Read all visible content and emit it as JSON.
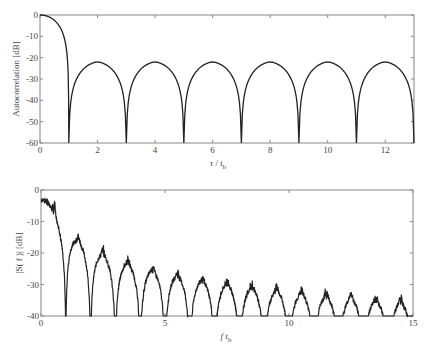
{
  "chart_data": [
    {
      "type": "line",
      "title": "",
      "xlabel": "τ / t_b",
      "ylabel": "Autocorrelation [dB]",
      "xlim": [
        0,
        13
      ],
      "ylim": [
        -60,
        0
      ],
      "xticks": [
        0,
        2,
        4,
        6,
        8,
        10,
        12
      ],
      "yticks": [
        0,
        -10,
        -20,
        -30,
        -40,
        -50,
        -60
      ],
      "grid": false,
      "legend": null,
      "description": "Main lobe falls from 0 dB at τ=0 to null at τ=1; sidelobe arches peak at about -22 dB at even τ with nulls at odd τ",
      "series": [
        {
          "name": "autocorrelation",
          "x": [
            0,
            0.25,
            0.5,
            0.75,
            0.9,
            1,
            1.1,
            1.5,
            2,
            2.5,
            2.9,
            3,
            3.1,
            3.5,
            4,
            4.5,
            4.9,
            5,
            5.1,
            5.5,
            6,
            6.5,
            6.9,
            7,
            7.1,
            7.5,
            8,
            8.5,
            8.9,
            9,
            9.1,
            9.5,
            10,
            10.5,
            10.9,
            11,
            11.1,
            11.5,
            12,
            12.5,
            12.9,
            13
          ],
          "values": [
            0,
            -1.5,
            -4.5,
            -10.5,
            -18,
            -60,
            -42,
            -28,
            -22,
            -28,
            -42,
            -60,
            -42,
            -28,
            -22,
            -28,
            -42,
            -60,
            -42,
            -28,
            -22,
            -28,
            -42,
            -60,
            -42,
            -28,
            -22,
            -28,
            -42,
            -60,
            -42,
            -28,
            -22,
            -28,
            -42,
            -60,
            -42,
            -28,
            -22,
            -28,
            -42,
            -50
          ]
        }
      ]
    },
    {
      "type": "line",
      "title": "",
      "xlabel": "f t_b",
      "ylabel": "|S(f)| [dB]",
      "xlim": [
        0,
        15
      ],
      "ylim": [
        -40,
        0
      ],
      "xticks": [
        0,
        5,
        10,
        15
      ],
      "yticks": [
        0,
        -10,
        -20,
        -30,
        -40
      ],
      "grid": false,
      "legend": null,
      "description": "Noisy sinc-like spectrum: main lobe from about -3 dB with null at f=1; sidelobe peaks decrease from about -16 dB to about -30 dB with nulls at integer f",
      "series": [
        {
          "name": "spectrum",
          "x": [
            0,
            0.5,
            1,
            1.5,
            2,
            2.5,
            3,
            3.5,
            4,
            4.5,
            5,
            5.5,
            6,
            6.5,
            7,
            7.5,
            8,
            8.5,
            9,
            9.5,
            10,
            10.5,
            11,
            11.5,
            12,
            12.5,
            13,
            13.5,
            14,
            14.5,
            15
          ],
          "values": [
            -3,
            -6,
            -40,
            -16,
            -40,
            -21,
            -40,
            -24,
            -40,
            -25.5,
            -40,
            -26.5,
            -40,
            -27,
            -40,
            -28,
            -40,
            -28.5,
            -40,
            -29,
            -40,
            -29.5,
            -40,
            -30,
            -40,
            -30,
            -40,
            -30.5,
            -40,
            -30.5,
            -40
          ]
        }
      ]
    }
  ],
  "labels": {
    "top_ylabel": "Autocorrelation [dB]",
    "top_xlabel_main": "τ / t",
    "top_xlabel_sub": "b",
    "bottom_ylabel": "|S( f )| [dB]",
    "bottom_xlabel_main": "f t",
    "bottom_xlabel_sub": "b"
  }
}
